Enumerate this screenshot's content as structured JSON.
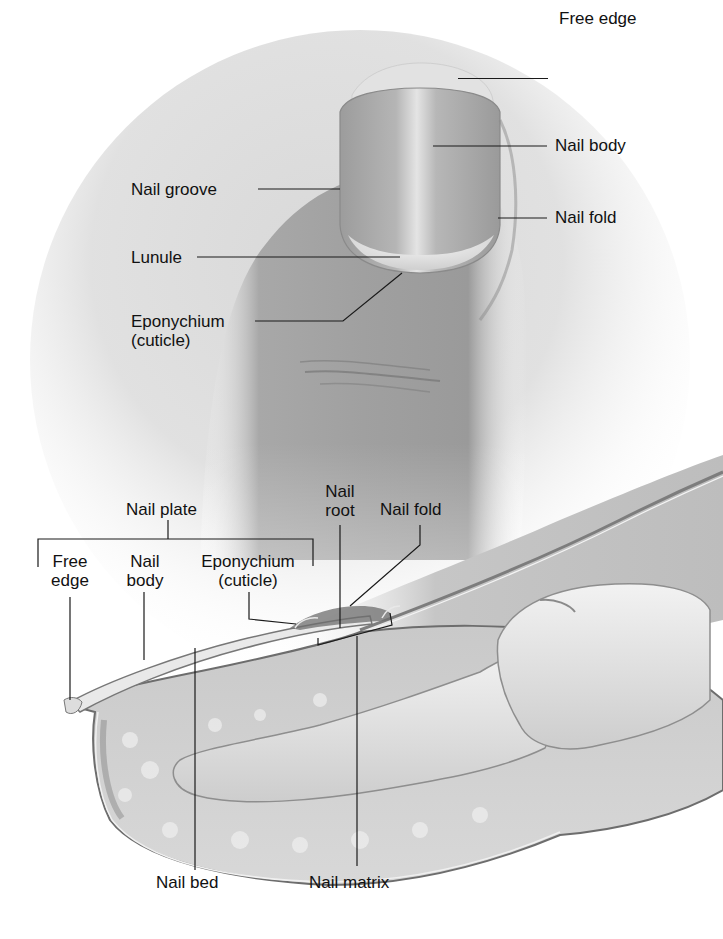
{
  "figure": {
    "colors": {
      "background": "#ffffff",
      "skin_dark": "#8f8f8f",
      "skin_mid": "#b4b4b4",
      "skin_light": "#d8d8d8",
      "nail_light": "#e6e6e6",
      "leader_line": "#1a1a1a",
      "label_text": "#111111"
    }
  },
  "surface_view": {
    "labels": [
      {
        "id": "free-edge",
        "text": "Free edge"
      },
      {
        "id": "nail-body",
        "text": "Nail body"
      },
      {
        "id": "nail-fold",
        "text": "Nail fold"
      },
      {
        "id": "nail-groove",
        "text": "Nail groove"
      },
      {
        "id": "lunule",
        "text": "Lunule"
      },
      {
        "id": "eponychium",
        "line1": "Eponychium",
        "line2": "(cuticle)"
      }
    ]
  },
  "sectional_view": {
    "bracket_group": {
      "title": "Nail plate",
      "members": [
        {
          "id": "free-edge",
          "line1": "Free",
          "line2": "edge"
        },
        {
          "id": "nail-body",
          "line1": "Nail",
          "line2": "body"
        },
        {
          "id": "eponychium",
          "line1": "Eponychium",
          "line2": "(cuticle)"
        }
      ]
    },
    "labels": [
      {
        "id": "nail-root",
        "line1": "Nail",
        "line2": "root"
      },
      {
        "id": "nail-fold",
        "text": "Nail fold"
      },
      {
        "id": "nail-bed",
        "text": "Nail bed"
      },
      {
        "id": "nail-matrix",
        "text": "Nail matrix"
      }
    ]
  }
}
